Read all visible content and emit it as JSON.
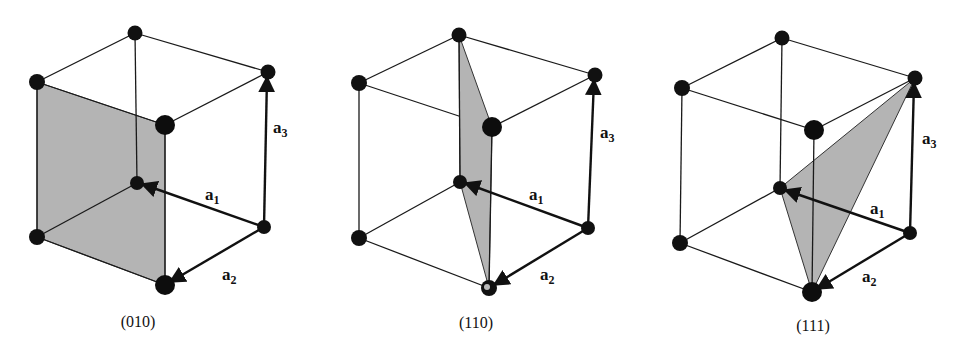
{
  "figure": {
    "panels": [
      {
        "id": "panel-010",
        "caption": "(010)",
        "plane_miller_indices": "(010)",
        "plane_vertices": [
          "top-left",
          "top-front",
          "bottom-front",
          "bottom-left"
        ],
        "vectors": [
          {
            "name": "a",
            "subscript": "1"
          },
          {
            "name": "a",
            "subscript": "2"
          },
          {
            "name": "a",
            "subscript": "3"
          }
        ]
      },
      {
        "id": "panel-110",
        "caption": "(110)",
        "plane_miller_indices": "(110)",
        "plane_vertices": [
          "top-back",
          "top-front",
          "bottom-front",
          "origin"
        ],
        "vectors": [
          {
            "name": "a",
            "subscript": "1"
          },
          {
            "name": "a",
            "subscript": "2"
          },
          {
            "name": "a",
            "subscript": "3"
          }
        ]
      },
      {
        "id": "panel-111",
        "caption": "(111)",
        "plane_miller_indices": "(111)",
        "plane_vertices": [
          "top-right",
          "origin",
          "bottom-front"
        ],
        "vectors": [
          {
            "name": "a",
            "subscript": "1"
          },
          {
            "name": "a",
            "subscript": "2"
          },
          {
            "name": "a",
            "subscript": "3"
          }
        ]
      }
    ],
    "colors": {
      "plane_fill": "#b4b4b4",
      "atom": "#111111",
      "line": "#1a1a1a",
      "background": "#ffffff"
    }
  }
}
